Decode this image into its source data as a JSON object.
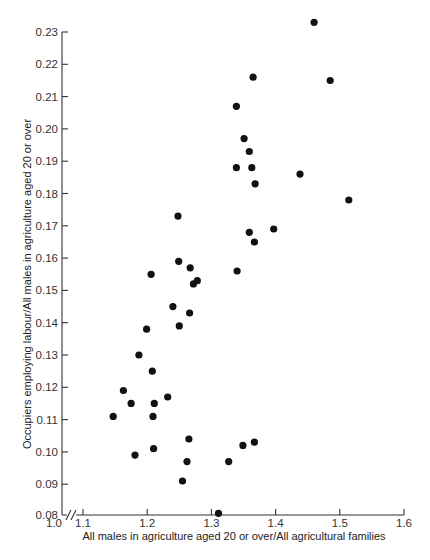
{
  "chart_data": {
    "type": "scatter",
    "title": "",
    "xlabel": "All males in agriculture aged 20 or over/All agricultural families",
    "ylabel": "Occupiers employing labour/All males in agriculture aged 20 or over",
    "xlim": [
      1.0,
      1.6
    ],
    "ylim": [
      0.08,
      0.23
    ],
    "x_axis_break": true,
    "x_ticks": [
      "1.0",
      "1.1",
      "1.2",
      "1.3",
      "1.4",
      "1.5",
      "1.6"
    ],
    "y_ticks": [
      "0.08",
      "0.09",
      "0.10",
      "0.11",
      "0.12",
      "0.13",
      "0.14",
      "0.15",
      "0.16",
      "0.17",
      "0.18",
      "0.19",
      "0.20",
      "0.21",
      "0.22",
      "0.23"
    ],
    "grid": false,
    "legend": null,
    "marker_color": "#111111",
    "points": [
      {
        "x": 1.46,
        "y": 0.233
      },
      {
        "x": 1.485,
        "y": 0.215
      },
      {
        "x": 1.365,
        "y": 0.216
      },
      {
        "x": 1.339,
        "y": 0.207
      },
      {
        "x": 1.351,
        "y": 0.197
      },
      {
        "x": 1.359,
        "y": 0.193
      },
      {
        "x": 1.339,
        "y": 0.188
      },
      {
        "x": 1.363,
        "y": 0.188
      },
      {
        "x": 1.438,
        "y": 0.186
      },
      {
        "x": 1.368,
        "y": 0.183
      },
      {
        "x": 1.514,
        "y": 0.178
      },
      {
        "x": 1.359,
        "y": 0.168
      },
      {
        "x": 1.397,
        "y": 0.169
      },
      {
        "x": 1.367,
        "y": 0.165
      },
      {
        "x": 1.34,
        "y": 0.156
      },
      {
        "x": 1.248,
        "y": 0.173
      },
      {
        "x": 1.249,
        "y": 0.159
      },
      {
        "x": 1.267,
        "y": 0.157
      },
      {
        "x": 1.206,
        "y": 0.155
      },
      {
        "x": 1.278,
        "y": 0.153
      },
      {
        "x": 1.272,
        "y": 0.152
      },
      {
        "x": 1.24,
        "y": 0.145
      },
      {
        "x": 1.266,
        "y": 0.143
      },
      {
        "x": 1.199,
        "y": 0.138
      },
      {
        "x": 1.25,
        "y": 0.139
      },
      {
        "x": 1.187,
        "y": 0.13
      },
      {
        "x": 1.208,
        "y": 0.125
      },
      {
        "x": 1.163,
        "y": 0.119
      },
      {
        "x": 1.175,
        "y": 0.115
      },
      {
        "x": 1.211,
        "y": 0.115
      },
      {
        "x": 1.232,
        "y": 0.117
      },
      {
        "x": 1.147,
        "y": 0.111
      },
      {
        "x": 1.209,
        "y": 0.111
      },
      {
        "x": 1.265,
        "y": 0.104
      },
      {
        "x": 1.21,
        "y": 0.101
      },
      {
        "x": 1.181,
        "y": 0.099
      },
      {
        "x": 1.262,
        "y": 0.097
      },
      {
        "x": 1.327,
        "y": 0.097
      },
      {
        "x": 1.349,
        "y": 0.102
      },
      {
        "x": 1.367,
        "y": 0.103
      },
      {
        "x": 1.255,
        "y": 0.091
      },
      {
        "x": 1.311,
        "y": 0.081
      }
    ]
  }
}
